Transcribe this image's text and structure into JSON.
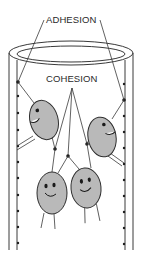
{
  "diagram": {
    "labels": {
      "adhesion": "ADHESION",
      "cohesion": "COHESION"
    },
    "colors": {
      "line": "#3a3a3a",
      "molecule_fill": "#b9b9b9",
      "molecule_stroke": "#2e2e2e",
      "dot": "#1e1e1e",
      "background": "#ffffff"
    },
    "tube": {
      "outer_left_x": 9,
      "inner_left_x": 17,
      "inner_right_x": 125,
      "outer_right_x": 133,
      "top_y": 53,
      "bottom_y": 250
    },
    "molecules": [
      {
        "id": "molecule-top-left",
        "cx": 44,
        "cy": 120,
        "rx": 14,
        "ry": 20,
        "rotate": -15
      },
      {
        "id": "molecule-top-right",
        "cx": 102,
        "cy": 137,
        "rx": 14,
        "ry": 20,
        "rotate": -10
      },
      {
        "id": "molecule-bottom-left",
        "cx": 52,
        "cy": 193,
        "rx": 15,
        "ry": 21,
        "rotate": 0
      },
      {
        "id": "molecule-bottom-right",
        "cx": 86,
        "cy": 188,
        "rx": 15,
        "ry": 20,
        "rotate": -5
      }
    ]
  }
}
